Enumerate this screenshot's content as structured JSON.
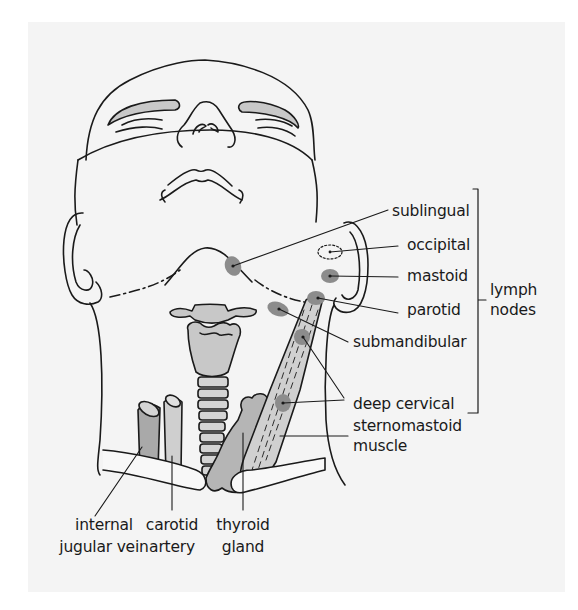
{
  "diagram": {
    "type": "anatomical-illustration",
    "colors": {
      "background": "#f4f4f4",
      "outline": "#1a1a1a",
      "structure_fill": "#c8c8c8",
      "vein_fill": "#a9a9a9",
      "node_fill": "#8c8c8c",
      "eyebrow_fill": "#c8c8c8"
    },
    "lymph_nodes": {
      "group_label": [
        "lymph",
        "nodes"
      ],
      "items": [
        {
          "id": "sublingual",
          "label": "sublingual"
        },
        {
          "id": "occipital",
          "label": "occipital"
        },
        {
          "id": "mastoid",
          "label": "mastoid"
        },
        {
          "id": "parotid",
          "label": "parotid"
        },
        {
          "id": "submandibular",
          "label": "submandibular"
        },
        {
          "id": "deep-cervical",
          "label": "deep cervical"
        }
      ]
    },
    "structures": [
      {
        "id": "sternomastoid-muscle",
        "label_lines": [
          "sternomastoid",
          "muscle"
        ]
      },
      {
        "id": "internal-jugular-vein",
        "label_lines": [
          "internal",
          "jugular vein"
        ]
      },
      {
        "id": "carotid-artery",
        "label_lines": [
          "carotid",
          "artery"
        ]
      },
      {
        "id": "thyroid-gland",
        "label_lines": [
          "thyroid",
          "gland"
        ]
      }
    ]
  }
}
